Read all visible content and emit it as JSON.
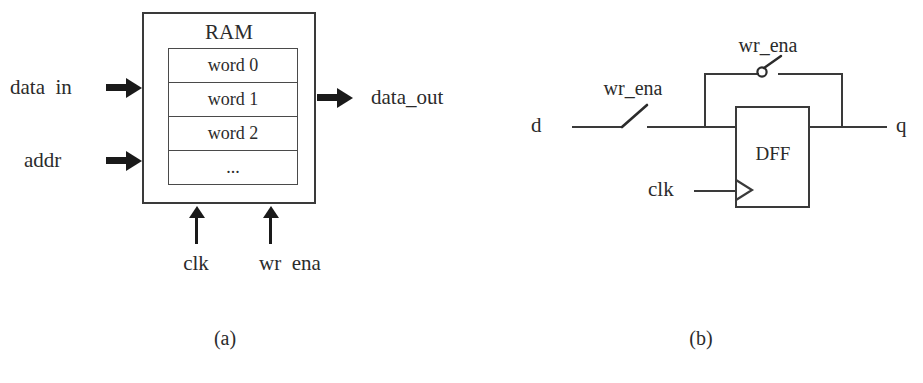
{
  "figure": {
    "background_color": "#ffffff",
    "line_color": "#3a3a3a",
    "text_color": "#2b2b2b"
  },
  "panel_a": {
    "caption": "(a)",
    "block_title": "RAM",
    "words": [
      "word 0",
      "word 1",
      "word 2",
      "..."
    ],
    "inputs_left": [
      {
        "label": "data  in"
      },
      {
        "label": "addr"
      }
    ],
    "outputs_right": [
      {
        "label": "data_out"
      }
    ],
    "inputs_bottom": [
      {
        "label": "clk"
      },
      {
        "label": "wr  ena"
      }
    ]
  },
  "panel_b": {
    "caption": "(b)",
    "block_label": "DFF",
    "input_label": "d",
    "output_label": "q",
    "clock_label": "clk",
    "switch_closed_label": "wr_ena",
    "switch_open_label": "wr_ena"
  }
}
